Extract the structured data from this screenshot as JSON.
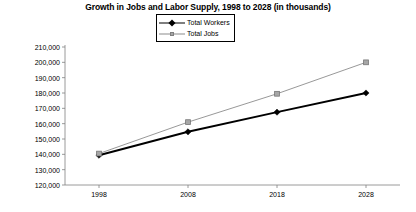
{
  "chart_data": {
    "type": "line",
    "title": "Growth in Jobs and Labor Supply, 1998 to 2028 (in thousands)",
    "xlabel": "",
    "ylabel": "",
    "categories": [
      "1998",
      "2008",
      "2018",
      "2028"
    ],
    "x": [
      1998,
      2008,
      2018,
      2028
    ],
    "series": [
      {
        "name": "Total Workers",
        "values": [
          139400,
          154700,
          167500,
          180000
        ],
        "color": "#000000",
        "marker": "diamond"
      },
      {
        "name": "Total Jobs",
        "values": [
          140500,
          161000,
          179500,
          200000
        ],
        "color": "#8c8c8c",
        "marker": "square"
      }
    ],
    "ylim": [
      120000,
      210000
    ],
    "ytick_values": [
      120000,
      130000,
      140000,
      150000,
      160000,
      170000,
      180000,
      190000,
      200000,
      210000
    ],
    "ytick_labels": [
      "120,000",
      "130,000",
      "140,000",
      "150,000",
      "160,000",
      "170,000",
      "180,000",
      "190,000",
      "200,000",
      "210,000"
    ],
    "xtick_labels": [
      "1998",
      "2008",
      "2018",
      "2028"
    ],
    "grid": false,
    "legend_position": "top-center"
  },
  "legend": {
    "items": [
      {
        "label": "Total Workers"
      },
      {
        "label": "Total Jobs"
      }
    ]
  },
  "axes": {
    "y_labels": [
      "210,000",
      "200,000",
      "190,000",
      "180,000",
      "170,000",
      "160,000",
      "150,000",
      "140,000",
      "130,000",
      "120,000"
    ],
    "x_labels": [
      "1998",
      "2008",
      "2018",
      "2028"
    ]
  },
  "colors": {
    "workers_line": "#000000",
    "jobs_line": "#8c8c8c",
    "axis": "#808080",
    "text": "#000000",
    "background": "#ffffff"
  }
}
